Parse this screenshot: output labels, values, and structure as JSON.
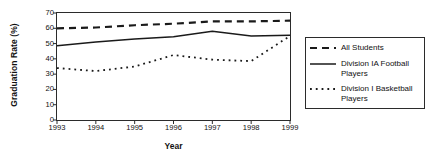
{
  "chart_data": {
    "type": "line",
    "title": "",
    "xlabel": "Year",
    "ylabel": "Graduation Rate (%)",
    "categories": [
      "1993",
      "1994",
      "1995",
      "1996",
      "1997",
      "1998",
      "1999"
    ],
    "x": [
      1993,
      1994,
      1995,
      1996,
      1997,
      1998,
      1999
    ],
    "xlim": [
      1993,
      1999
    ],
    "ylim": [
      0,
      70
    ],
    "yticks": [
      0,
      10,
      20,
      30,
      40,
      50,
      60,
      70
    ],
    "ytick_labels": [
      "0",
      "10",
      "20",
      "30",
      "40",
      "50",
      "60",
      "70"
    ],
    "grid": false,
    "legend_position": "right",
    "series": [
      {
        "name": "All Students",
        "style": "dashed",
        "color": "#1a1a1a",
        "values": [
          60,
          60.5,
          62,
          63,
          64.5,
          64.5,
          65
        ]
      },
      {
        "name": "Division IA Football Players",
        "style": "solid",
        "color": "#1a1a1a",
        "values": [
          48.5,
          51,
          53,
          54.5,
          58,
          55,
          55.5
        ]
      },
      {
        "name": "Division I Basketball Players",
        "style": "dotted",
        "color": "#1a1a1a",
        "values": [
          34,
          32,
          35,
          42.5,
          39.5,
          38.5,
          55
        ]
      }
    ]
  },
  "legend": {
    "entries": [
      {
        "label": "All Students"
      },
      {
        "label": "Division IA Football Players"
      },
      {
        "label": "Division I Basketball Players"
      }
    ]
  }
}
